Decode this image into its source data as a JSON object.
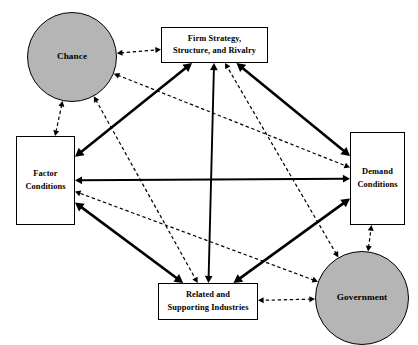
{
  "diagram": {
    "background_color": "#ffffff",
    "line_color": "#000000",
    "node_fill_box": "#ffffff",
    "node_fill_circle": "#b5b5b5",
    "nodes": [
      {
        "id": "chance",
        "label": "Chance",
        "shape": "circle",
        "cx": 72,
        "cy": 57,
        "r": 45
      },
      {
        "id": "firm",
        "label": "Firm Strategy,\nStructure, and Rivalry",
        "line1": "Firm Strategy,",
        "line2": "Structure, and Rivalry",
        "shape": "rect",
        "x": 161,
        "y": 27,
        "w": 107,
        "h": 36
      },
      {
        "id": "factor",
        "label": "Factor\nConditions",
        "line1": "Factor",
        "line2": "Conditions",
        "shape": "rect",
        "x": 16,
        "y": 136,
        "w": 59,
        "h": 89
      },
      {
        "id": "demand",
        "label": "Demand\nConditions",
        "line1": "Demand",
        "line2": "Conditions",
        "shape": "rect",
        "x": 350,
        "y": 132,
        "w": 55,
        "h": 93
      },
      {
        "id": "related",
        "label": "Related and\nSupporting Industries",
        "line1": "Related and",
        "line2": "Supporting Industries",
        "shape": "rect",
        "x": 158,
        "y": 283,
        "w": 100,
        "h": 37
      },
      {
        "id": "government",
        "label": "Government",
        "shape": "circle",
        "cx": 362,
        "cy": 298,
        "r": 47
      }
    ],
    "edges": [
      {
        "id": "firm-related-vertical",
        "from": "firm",
        "to": "related",
        "style": "solid",
        "arrows": "both",
        "weight": 1.9
      },
      {
        "id": "factor-demand-horizontal",
        "from": "factor",
        "to": "demand",
        "style": "solid",
        "arrows": "both",
        "weight": 1.9
      },
      {
        "id": "factor-firm",
        "from": "factor",
        "to": "firm",
        "style": "solid",
        "arrows": "both",
        "weight": 2.6
      },
      {
        "id": "firm-demand",
        "from": "firm",
        "to": "demand",
        "style": "solid",
        "arrows": "both",
        "weight": 2.6
      },
      {
        "id": "factor-related",
        "from": "factor",
        "to": "related",
        "style": "solid",
        "arrows": "both",
        "weight": 2.6
      },
      {
        "id": "related-demand",
        "from": "related",
        "to": "demand",
        "style": "solid",
        "arrows": "both",
        "weight": 2.6
      },
      {
        "id": "chance-firm",
        "from": "chance",
        "to": "firm",
        "style": "dashed",
        "arrows": "both",
        "weight": 1.2
      },
      {
        "id": "chance-factor",
        "from": "chance",
        "to": "factor",
        "style": "dashed",
        "arrows": "both",
        "weight": 1.2
      },
      {
        "id": "chance-demand",
        "from": "chance",
        "to": "demand",
        "style": "dashed",
        "arrows": "both",
        "weight": 1.2
      },
      {
        "id": "chance-related",
        "from": "chance",
        "to": "related",
        "style": "dashed",
        "arrows": "both",
        "weight": 1.2
      },
      {
        "id": "government-firm",
        "from": "government",
        "to": "firm",
        "style": "dashed",
        "arrows": "both",
        "weight": 1.2
      },
      {
        "id": "government-factor",
        "from": "government",
        "to": "factor",
        "style": "dashed",
        "arrows": "both",
        "weight": 1.2
      },
      {
        "id": "government-demand",
        "from": "government",
        "to": "demand",
        "style": "dashed",
        "arrows": "both",
        "weight": 1.2
      },
      {
        "id": "government-related",
        "from": "government",
        "to": "related",
        "style": "dashed",
        "arrows": "both",
        "weight": 1.2
      }
    ]
  }
}
